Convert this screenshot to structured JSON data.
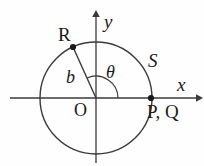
{
  "figure": {
    "background_color": "#fefefe",
    "stroke_color": "#3a3a3a",
    "label_color": "#1a1a1a"
  },
  "axes": {
    "x_label": "x",
    "y_label": "y",
    "origin_label": "O",
    "x_axis_start": 10,
    "x_axis_end": 200,
    "y_axis_top": 13,
    "y_axis_bottom": 163,
    "origin_x": 96,
    "origin_y": 98
  },
  "circle": {
    "center_x": 96,
    "center_y": 98,
    "radius": 56
  },
  "points": [
    {
      "name": "R",
      "label": "R",
      "x": 73,
      "y": 47,
      "marker": true
    },
    {
      "name": "PQ",
      "label": "P, Q",
      "x": 151,
      "y": 98,
      "marker": true
    },
    {
      "name": "S",
      "label": "S",
      "x": 143,
      "y": 64,
      "marker": false
    }
  ],
  "radius_segment": {
    "label": "b",
    "from_x": 96,
    "from_y": 98,
    "to_x": 73,
    "to_y": 47
  },
  "angle": {
    "label": "θ",
    "arc_radius": 22,
    "start_deg": 0,
    "end_deg": 114
  }
}
